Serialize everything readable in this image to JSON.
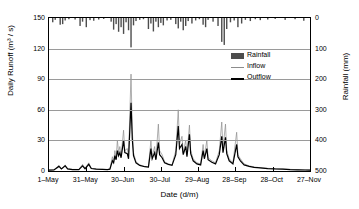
{
  "chart_data": {
    "type": "line",
    "title": "",
    "xlabel": "Date (d/m)",
    "ylabel": "Daily Runoff (m³ / s)",
    "ylabel_right": "Rainfall (mm)",
    "xlim": [
      0,
      210
    ],
    "ylim": [
      0,
      150
    ],
    "ylim_right": [
      0,
      500
    ],
    "ylim_right_inverted": true,
    "grid": true,
    "legend_position": "upper-right",
    "yticks": [
      0,
      30,
      60,
      90,
      120,
      150
    ],
    "ytick_labels": [
      "0",
      "30",
      "60",
      "90",
      "120",
      "150"
    ],
    "yticks_right": [
      0,
      100,
      200,
      300,
      400,
      500
    ],
    "ytick_labels_right": [
      "0",
      "100",
      "200",
      "300",
      "400",
      "500"
    ],
    "xticks": [
      0,
      30,
      60,
      90,
      120,
      150,
      180,
      210
    ],
    "xtick_labels": [
      "1–May",
      "31–May",
      "30–Jun",
      "30–Jul",
      "29–Aug",
      "28–Sep",
      "28–Oct",
      "27–Nov"
    ],
    "series": [
      {
        "name": "Rainfall",
        "type": "bar",
        "axis": "right",
        "color": "#4d4d4d",
        "unit": "mm",
        "points": [
          [
            3,
            14
          ],
          [
            5,
            6
          ],
          [
            9,
            22
          ],
          [
            11,
            20
          ],
          [
            13,
            8
          ],
          [
            16,
            4
          ],
          [
            21,
            5
          ],
          [
            25,
            26
          ],
          [
            27,
            12
          ],
          [
            30,
            30
          ],
          [
            33,
            7
          ],
          [
            36,
            9
          ],
          [
            40,
            5
          ],
          [
            44,
            3
          ],
          [
            50,
            12
          ],
          [
            52,
            38
          ],
          [
            54,
            20
          ],
          [
            56,
            45
          ],
          [
            58,
            30
          ],
          [
            60,
            52
          ],
          [
            62,
            14
          ],
          [
            64,
            40
          ],
          [
            66,
            96
          ],
          [
            68,
            24
          ],
          [
            70,
            10
          ],
          [
            73,
            6
          ],
          [
            76,
            4
          ],
          [
            80,
            36
          ],
          [
            82,
            18
          ],
          [
            84,
            44
          ],
          [
            86,
            12
          ],
          [
            88,
            30
          ],
          [
            90,
            16
          ],
          [
            92,
            24
          ],
          [
            95,
            8
          ],
          [
            98,
            6
          ],
          [
            102,
            20
          ],
          [
            104,
            34
          ],
          [
            106,
            12
          ],
          [
            108,
            40
          ],
          [
            110,
            26
          ],
          [
            112,
            10
          ],
          [
            115,
            18
          ],
          [
            118,
            8
          ],
          [
            121,
            4
          ],
          [
            124,
            22
          ],
          [
            126,
            30
          ],
          [
            128,
            6
          ],
          [
            132,
            12
          ],
          [
            136,
            26
          ],
          [
            139,
            78
          ],
          [
            141,
            88
          ],
          [
            143,
            36
          ],
          [
            146,
            14
          ],
          [
            149,
            8
          ],
          [
            152,
            30
          ],
          [
            155,
            18
          ],
          [
            158,
            6
          ],
          [
            162,
            10
          ],
          [
            166,
            4
          ],
          [
            170,
            7
          ],
          [
            176,
            5
          ],
          [
            182,
            3
          ],
          [
            190,
            6
          ],
          [
            198,
            4
          ],
          [
            205,
            9
          ]
        ]
      },
      {
        "name": "Inflow",
        "type": "line",
        "axis": "left",
        "color": "#8c8c8c",
        "unit": "m3/s",
        "peak_values": [
          8,
          14,
          30,
          40,
          95,
          46,
          34,
          60,
          45,
          30,
          26,
          48,
          46,
          38
        ],
        "points": [
          [
            0,
            1.0
          ],
          [
            4,
            1.2
          ],
          [
            8,
            5.5
          ],
          [
            10,
            2.0
          ],
          [
            13,
            6.0
          ],
          [
            15,
            2.0
          ],
          [
            19,
            1.6
          ],
          [
            24,
            1.5
          ],
          [
            27,
            6.5
          ],
          [
            29,
            2.4
          ],
          [
            32,
            8.0
          ],
          [
            34,
            2.6
          ],
          [
            38,
            2.0
          ],
          [
            43,
            1.6
          ],
          [
            47,
            1.4
          ],
          [
            49,
            2.0
          ],
          [
            51,
            14.0
          ],
          [
            52,
            9.0
          ],
          [
            53,
            20.0
          ],
          [
            54,
            12.0
          ],
          [
            55,
            30.0
          ],
          [
            56,
            18.0
          ],
          [
            57,
            24.0
          ],
          [
            58,
            15.0
          ],
          [
            60,
            40.0
          ],
          [
            61,
            20.0
          ],
          [
            63,
            22.0
          ],
          [
            64,
            14.0
          ],
          [
            66,
            95.0
          ],
          [
            67,
            40.0
          ],
          [
            68,
            18.0
          ],
          [
            70,
            9.0
          ],
          [
            73,
            6.0
          ],
          [
            77,
            4.5
          ],
          [
            80,
            4.0
          ],
          [
            82,
            30.0
          ],
          [
            83,
            14.0
          ],
          [
            85,
            24.0
          ],
          [
            86,
            12.0
          ],
          [
            88,
            46.0
          ],
          [
            89,
            20.0
          ],
          [
            91,
            16.0
          ],
          [
            93,
            9.0
          ],
          [
            96,
            7.0
          ],
          [
            99,
            6.0
          ],
          [
            102,
            20.0
          ],
          [
            104,
            60.0
          ],
          [
            105,
            26.0
          ],
          [
            107,
            34.0
          ],
          [
            108,
            18.0
          ],
          [
            110,
            30.0
          ],
          [
            111,
            16.0
          ],
          [
            113,
            45.0
          ],
          [
            114,
            20.0
          ],
          [
            116,
            12.0
          ],
          [
            119,
            8.0
          ],
          [
            122,
            7.0
          ],
          [
            124,
            26.0
          ],
          [
            125,
            14.0
          ],
          [
            127,
            30.0
          ],
          [
            128,
            13.0
          ],
          [
            131,
            10.0
          ],
          [
            134,
            8.0
          ],
          [
            137,
            20.0
          ],
          [
            139,
            48.0
          ],
          [
            140,
            22.0
          ],
          [
            142,
            46.0
          ],
          [
            143,
            20.0
          ],
          [
            145,
            12.0
          ],
          [
            148,
            8.0
          ],
          [
            151,
            38.0
          ],
          [
            152,
            16.0
          ],
          [
            154,
            12.0
          ],
          [
            157,
            7.0
          ],
          [
            161,
            5.0
          ],
          [
            165,
            4.0
          ],
          [
            170,
            3.2
          ],
          [
            176,
            2.6
          ],
          [
            182,
            2.2
          ],
          [
            188,
            2.0
          ],
          [
            194,
            1.6
          ],
          [
            200,
            1.3
          ],
          [
            206,
            1.1
          ],
          [
            210,
            1.0
          ]
        ]
      },
      {
        "name": "Outflow",
        "type": "line",
        "axis": "left",
        "color": "#000000",
        "unit": "m3/s",
        "peak_values": [
          6,
          8,
          20,
          30,
          67,
          28,
          22,
          44,
          36,
          22,
          20,
          34,
          33,
          26
        ],
        "points": [
          [
            0,
            0.8
          ],
          [
            4,
            1.0
          ],
          [
            8,
            4.5
          ],
          [
            10,
            2.0
          ],
          [
            13,
            5.0
          ],
          [
            15,
            2.0
          ],
          [
            19,
            1.4
          ],
          [
            24,
            1.3
          ],
          [
            27,
            5.0
          ],
          [
            29,
            2.2
          ],
          [
            32,
            6.5
          ],
          [
            34,
            2.4
          ],
          [
            38,
            1.8
          ],
          [
            43,
            1.5
          ],
          [
            47,
            1.3
          ],
          [
            49,
            1.8
          ],
          [
            51,
            10.0
          ],
          [
            52,
            8.0
          ],
          [
            53,
            15.0
          ],
          [
            54,
            11.0
          ],
          [
            55,
            20.0
          ],
          [
            56,
            15.0
          ],
          [
            57,
            18.0
          ],
          [
            58,
            13.0
          ],
          [
            60,
            30.0
          ],
          [
            61,
            18.0
          ],
          [
            63,
            17.0
          ],
          [
            64,
            12.0
          ],
          [
            66,
            67.0
          ],
          [
            67,
            32.0
          ],
          [
            68,
            15.0
          ],
          [
            70,
            8.0
          ],
          [
            73,
            5.5
          ],
          [
            77,
            4.2
          ],
          [
            80,
            3.8
          ],
          [
            82,
            22.0
          ],
          [
            83,
            12.0
          ],
          [
            85,
            18.0
          ],
          [
            86,
            11.0
          ],
          [
            88,
            28.0
          ],
          [
            89,
            16.0
          ],
          [
            91,
            13.0
          ],
          [
            93,
            8.0
          ],
          [
            96,
            6.5
          ],
          [
            99,
            5.5
          ],
          [
            102,
            16.0
          ],
          [
            104,
            44.0
          ],
          [
            105,
            22.0
          ],
          [
            107,
            26.0
          ],
          [
            108,
            16.0
          ],
          [
            110,
            24.0
          ],
          [
            111,
            14.0
          ],
          [
            113,
            36.0
          ],
          [
            114,
            17.0
          ],
          [
            116,
            10.0
          ],
          [
            119,
            7.0
          ],
          [
            122,
            6.0
          ],
          [
            124,
            20.0
          ],
          [
            125,
            12.0
          ],
          [
            127,
            22.0
          ],
          [
            128,
            11.0
          ],
          [
            131,
            8.5
          ],
          [
            134,
            7.0
          ],
          [
            137,
            16.0
          ],
          [
            139,
            34.0
          ],
          [
            140,
            18.0
          ],
          [
            142,
            33.0
          ],
          [
            143,
            17.0
          ],
          [
            145,
            10.0
          ],
          [
            148,
            7.0
          ],
          [
            151,
            26.0
          ],
          [
            152,
            14.0
          ],
          [
            154,
            10.0
          ],
          [
            157,
            6.0
          ],
          [
            161,
            4.5
          ],
          [
            165,
            3.6
          ],
          [
            170,
            3.0
          ],
          [
            176,
            2.4
          ],
          [
            182,
            2.0
          ],
          [
            188,
            1.8
          ],
          [
            194,
            1.4
          ],
          [
            200,
            1.2
          ],
          [
            206,
            1.0
          ],
          [
            210,
            0.9
          ]
        ]
      }
    ],
    "legend": [
      {
        "label": "Rainfall",
        "marker": "bar",
        "color": "#4d4d4d"
      },
      {
        "label": "Inflow",
        "marker": "line-thin",
        "color": "#8c8c8c"
      },
      {
        "label": "Outflow",
        "marker": "line-thick",
        "color": "#000000"
      }
    ]
  }
}
